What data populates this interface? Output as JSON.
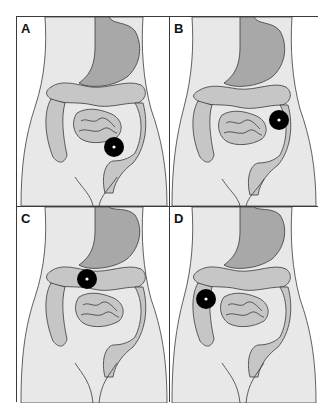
{
  "figure": {
    "panels": [
      {
        "label": "A",
        "marker": {
          "x": 97,
          "y": 130,
          "site": "sigmoid-colon"
        }
      },
      {
        "label": "B",
        "marker": {
          "x": 109,
          "y": 103,
          "site": "descending-colon"
        }
      },
      {
        "label": "C",
        "marker": {
          "x": 70,
          "y": 72,
          "site": "transverse-colon"
        }
      },
      {
        "label": "D",
        "marker": {
          "x": 36,
          "y": 92,
          "site": "ascending-colon"
        }
      }
    ],
    "colors": {
      "background": "#ffffff",
      "body_fill": "#e8e8e8",
      "organ_fill": "#c6c6c6",
      "stomach_fill": "#a8a8a8",
      "outline": "#3a3a3a",
      "marker": "#000000",
      "marker_center": "#ffffff"
    }
  }
}
